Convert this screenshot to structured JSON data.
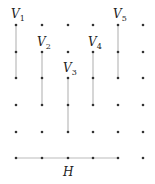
{
  "diagram": {
    "title": "",
    "grid": {
      "columns_x": [
        16,
        42,
        68,
        93,
        118,
        143
      ],
      "rows_y": [
        25,
        52,
        78,
        105,
        132,
        158
      ],
      "dot_color": "#333333"
    },
    "line_color": "#bbbbbb",
    "vertical_segments": [
      {
        "name": "V",
        "sub": "1",
        "x": 16,
        "y1": 25,
        "y2": 78,
        "label_x": 11,
        "label_y": 18
      },
      {
        "name": "V",
        "sub": "2",
        "x": 42,
        "y1": 52,
        "y2": 105,
        "label_x": 37,
        "label_y": 46
      },
      {
        "name": "V",
        "sub": "3",
        "x": 68,
        "y1": 78,
        "y2": 132,
        "label_x": 63,
        "label_y": 72
      },
      {
        "name": "V",
        "sub": "4",
        "x": 93,
        "y1": 52,
        "y2": 105,
        "label_x": 88,
        "label_y": 46
      },
      {
        "name": "V",
        "sub": "5",
        "x": 118,
        "y1": 25,
        "y2": 78,
        "label_x": 113,
        "label_y": 18
      }
    ],
    "horizontal_segments": [
      {
        "name": "H",
        "y": 158,
        "x1": 16,
        "x2": 118,
        "label_x": 63,
        "label_y": 176
      }
    ]
  }
}
